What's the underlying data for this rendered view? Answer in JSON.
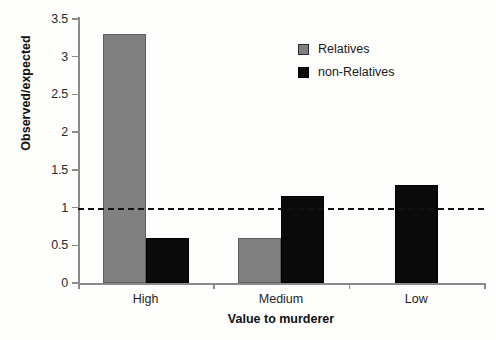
{
  "chart_data": {
    "type": "bar",
    "title": "",
    "xlabel": "Value to murderer",
    "ylabel": "Observed/expected",
    "categories": [
      "High",
      "Medium",
      "Low"
    ],
    "series": [
      {
        "name": "Relatives",
        "color": "#808080",
        "values": [
          3.3,
          0.6,
          null
        ]
      },
      {
        "name": "non-Relatives",
        "color": "#0a0a0a",
        "values": [
          0.6,
          1.15,
          1.3
        ]
      }
    ],
    "ylim": [
      0,
      3.5
    ],
    "yticks": [
      "0",
      "0.5",
      "1",
      "1.5",
      "2",
      "2.5",
      "3",
      "3.5"
    ],
    "ytick_values": [
      0,
      0.5,
      1,
      1.5,
      2,
      2.5,
      3,
      3.5
    ],
    "grid": false,
    "legend_position": "top-right",
    "annotations": [
      {
        "name": "reference-line",
        "type": "horizontal-dashed",
        "value": 1
      }
    ]
  },
  "legend": {
    "entries": [
      {
        "label": "Relatives"
      },
      {
        "label": "non-Relatives"
      }
    ]
  }
}
